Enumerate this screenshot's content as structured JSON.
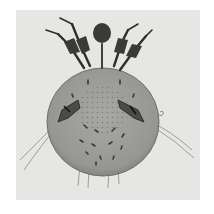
{
  "image": {
    "subject": "mite specimen micrograph",
    "description": "Grayscale micrograph of a mite with an oval body, four anterior legs, two mid-body leg groups, and long trailing setae",
    "colors": {
      "background": "#ffffff",
      "plate": "#e6e6e4",
      "body": "#9a9a96",
      "body_edge": "#6f6f6b",
      "dark": "#2e2e2c",
      "seta": "#8a8a86"
    }
  }
}
